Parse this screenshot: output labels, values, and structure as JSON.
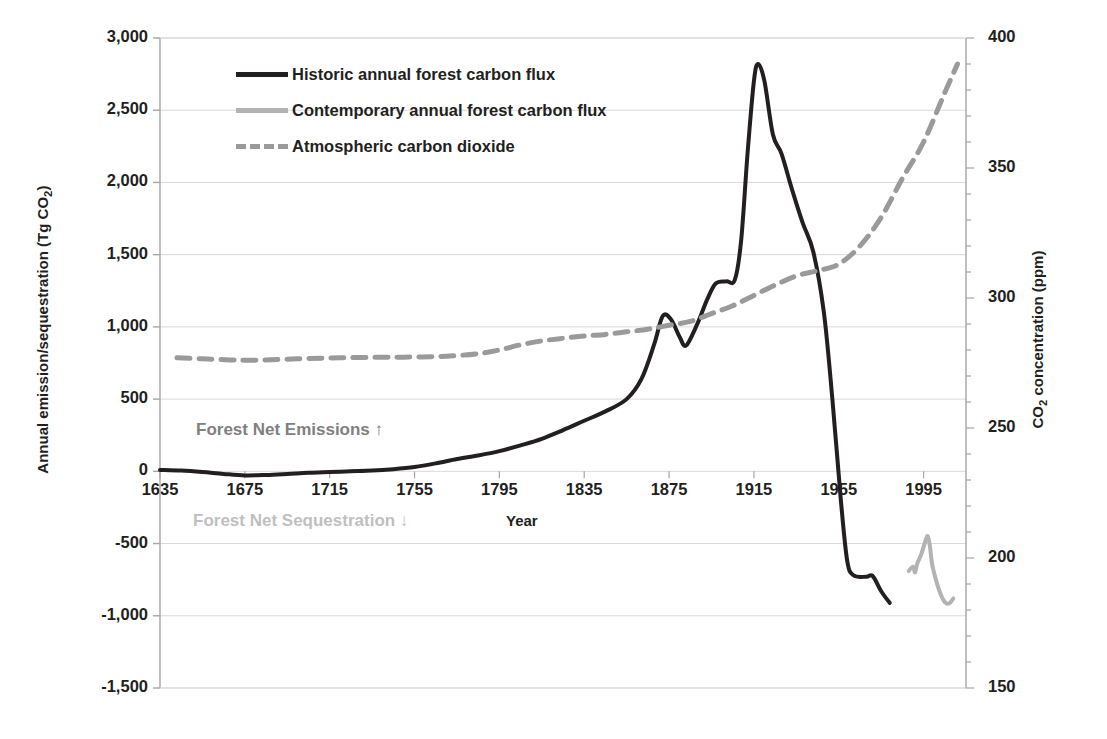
{
  "chart_data": {
    "type": "line",
    "title": "",
    "xlabel": "Year",
    "ylabel_left": "Annual emission/sequestration (Tg CO2)",
    "ylabel_right": "CO2 concentration (ppm)",
    "xlim": [
      1635,
      2015
    ],
    "xticks": [
      1635,
      1675,
      1715,
      1755,
      1795,
      1835,
      1875,
      1915,
      1955,
      1995
    ],
    "ylim_left": [
      -1500,
      3000
    ],
    "yticks_left": [
      -1500,
      -1000,
      -500,
      0,
      500,
      1000,
      1500,
      2000,
      2500,
      3000
    ],
    "ytick_labels_left": [
      "-1,500",
      "-1,000",
      "-500",
      "0",
      "500",
      "1,000",
      "1,500",
      "2,000",
      "2,500",
      "3,000"
    ],
    "ylim_right": [
      150,
      400
    ],
    "yticks_right": [
      150,
      200,
      250,
      300,
      350,
      400
    ],
    "ytick_labels_right": [
      "150",
      "200",
      "250",
      "300",
      "350",
      "400"
    ],
    "grid": "horizontal",
    "legend_position": "top-left-inside",
    "series": [
      {
        "name": "Historic annual forest carbon flux",
        "axis": "left",
        "color": "#231f20",
        "style": "solid",
        "width": 4,
        "points": [
          [
            1635,
            10
          ],
          [
            1645,
            5
          ],
          [
            1655,
            -5
          ],
          [
            1665,
            -18
          ],
          [
            1675,
            -28
          ],
          [
            1685,
            -25
          ],
          [
            1695,
            -18
          ],
          [
            1705,
            -10
          ],
          [
            1715,
            -5
          ],
          [
            1725,
            0
          ],
          [
            1735,
            5
          ],
          [
            1745,
            15
          ],
          [
            1755,
            30
          ],
          [
            1765,
            55
          ],
          [
            1775,
            85
          ],
          [
            1785,
            110
          ],
          [
            1795,
            140
          ],
          [
            1805,
            180
          ],
          [
            1815,
            225
          ],
          [
            1825,
            285
          ],
          [
            1835,
            350
          ],
          [
            1845,
            415
          ],
          [
            1855,
            500
          ],
          [
            1862,
            640
          ],
          [
            1868,
            880
          ],
          [
            1872,
            1075
          ],
          [
            1876,
            1050
          ],
          [
            1880,
            930
          ],
          [
            1883,
            870
          ],
          [
            1888,
            1010
          ],
          [
            1893,
            1190
          ],
          [
            1897,
            1300
          ],
          [
            1902,
            1315
          ],
          [
            1906,
            1325
          ],
          [
            1909,
            1600
          ],
          [
            1912,
            2200
          ],
          [
            1915,
            2700
          ],
          [
            1917,
            2820
          ],
          [
            1920,
            2700
          ],
          [
            1924,
            2330
          ],
          [
            1928,
            2200
          ],
          [
            1933,
            1950
          ],
          [
            1938,
            1720
          ],
          [
            1943,
            1520
          ],
          [
            1948,
            1100
          ],
          [
            1952,
            500
          ],
          [
            1956,
            -200
          ],
          [
            1959,
            -620
          ],
          [
            1962,
            -720
          ],
          [
            1968,
            -730
          ],
          [
            1971,
            -725
          ],
          [
            1975,
            -830
          ],
          [
            1979,
            -910
          ]
        ]
      },
      {
        "name": "Contemporary annual forest carbon flux",
        "axis": "left",
        "color": "#b3b3b3",
        "style": "solid",
        "width": 4,
        "points": [
          [
            1988,
            -690
          ],
          [
            1990,
            -660
          ],
          [
            1991,
            -700
          ],
          [
            1992,
            -640
          ],
          [
            1994,
            -570
          ],
          [
            1996,
            -475
          ],
          [
            1997,
            -450
          ],
          [
            1998,
            -520
          ],
          [
            1999,
            -640
          ],
          [
            2001,
            -760
          ],
          [
            2003,
            -850
          ],
          [
            2005,
            -905
          ],
          [
            2007,
            -915
          ],
          [
            2009,
            -880
          ]
        ]
      },
      {
        "name": "Atmospheric carbon dioxide",
        "axis": "right",
        "color": "#9a9a9a",
        "style": "dashed",
        "width": 5,
        "points": [
          [
            1643,
            277
          ],
          [
            1655,
            276.6
          ],
          [
            1668,
            276.2
          ],
          [
            1680,
            276.1
          ],
          [
            1700,
            276.6
          ],
          [
            1720,
            277
          ],
          [
            1740,
            277.2
          ],
          [
            1755,
            277.3
          ],
          [
            1770,
            277.6
          ],
          [
            1785,
            278.6
          ],
          [
            1795,
            280
          ],
          [
            1805,
            282
          ],
          [
            1815,
            283.5
          ],
          [
            1825,
            284.5
          ],
          [
            1835,
            285.4
          ],
          [
            1845,
            286
          ],
          [
            1855,
            287
          ],
          [
            1865,
            288
          ],
          [
            1875,
            289.5
          ],
          [
            1885,
            291
          ],
          [
            1895,
            294
          ],
          [
            1905,
            297
          ],
          [
            1915,
            301
          ],
          [
            1925,
            305
          ],
          [
            1935,
            308.5
          ],
          [
            1945,
            310.5
          ],
          [
            1955,
            313
          ],
          [
            1965,
            320
          ],
          [
            1975,
            331
          ],
          [
            1985,
            346
          ],
          [
            1995,
            360
          ],
          [
            2005,
            379
          ],
          [
            2011,
            390
          ]
        ]
      }
    ],
    "annotations": [
      {
        "text": "Forest Net Emissions ↑",
        "color": "#808080",
        "x": 1720,
        "y": 420
      },
      {
        "text": "Forest Net Sequestration ↓",
        "color": "#bfbfbf",
        "x": 1720,
        "y": -350
      }
    ]
  },
  "legend": {
    "items": [
      {
        "label": "Historic annual forest carbon flux",
        "key": "solid-dark-line-swatch"
      },
      {
        "label": "Contemporary annual forest carbon flux",
        "key": "solid-gray-line-swatch"
      },
      {
        "label": "Atmospheric carbon dioxide",
        "key": "dashed-gray-line-swatch"
      }
    ]
  },
  "axes": {
    "left_title_main": "Annual emission/sequestration (Tg CO",
    "left_title_sub": "2",
    "left_title_end": ")",
    "right_title_main": "CO",
    "right_title_sub": "2",
    "right_title_end": " concentration (ppm)",
    "x_title": "Year"
  },
  "annotations": {
    "emissions": "Forest Net Emissions ↑",
    "sequestration": "Forest Net Sequestration ↓"
  },
  "colors": {
    "historic": "#231f20",
    "contemporary": "#b3b3b3",
    "co2": "#9a9a9a",
    "grid": "#d9d9d9",
    "axis": "#a6a6a6",
    "emissions_text": "#808080",
    "sequestration_text": "#bfbfbf"
  }
}
